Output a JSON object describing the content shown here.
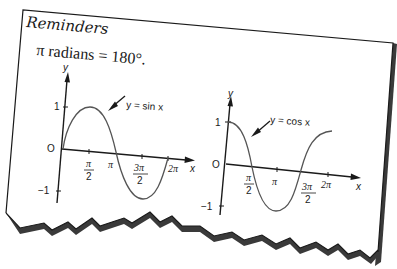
{
  "card": {
    "title": "Reminders",
    "formula": "π radians = 180°."
  },
  "colors": {
    "background": "#ffffff",
    "ink": "#1a1a1a",
    "curve": "#555555",
    "shadow": "#3a3a3a"
  },
  "graphs": [
    {
      "name": "sine",
      "curve_label": "y = sin x",
      "y_axis_label": "y",
      "x_axis_label": "x",
      "origin_label": "O",
      "y_ticks": [
        "1",
        "−1"
      ],
      "x_ticks": [
        {
          "num": "π",
          "den": "2"
        },
        {
          "text": "π"
        },
        {
          "num": "3π",
          "den": "2"
        },
        {
          "text": "2π"
        }
      ]
    },
    {
      "name": "cosine",
      "curve_label": "y = cos x",
      "y_axis_label": "y",
      "x_axis_label": "x",
      "origin_label": "O",
      "y_ticks": [
        "1",
        "−1"
      ],
      "x_ticks": [
        {
          "num": "π",
          "den": "2"
        },
        {
          "text": "π"
        },
        {
          "num": "3π",
          "den": "2"
        },
        {
          "text": "2π"
        }
      ]
    }
  ]
}
